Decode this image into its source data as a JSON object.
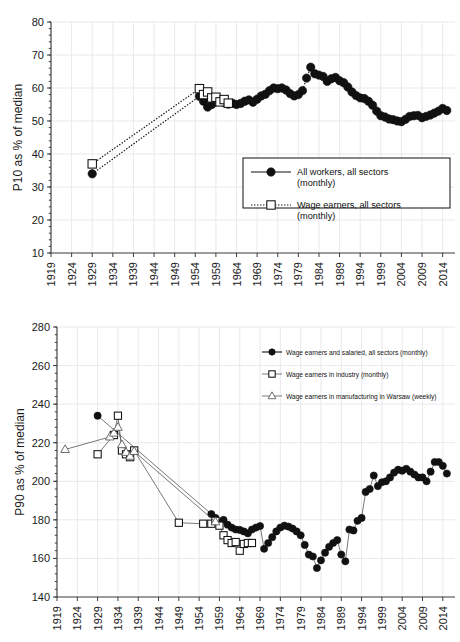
{
  "page": {
    "title_faint": ""
  },
  "charts": [
    {
      "id": "p10",
      "ylabel": "P10 as % of median",
      "xlabel": "",
      "legend_position": "inside-right"
    },
    {
      "id": "p90",
      "ylabel": "P90 as % of median",
      "xlabel": "",
      "legend_position": "inside-top-right"
    }
  ],
  "chart_data": [
    {
      "type": "line",
      "title": "",
      "xlabel": "",
      "ylabel": "P10 as % of median",
      "xlim": [
        1919,
        2017
      ],
      "ylim": [
        10,
        80
      ],
      "yticks": [
        10,
        20,
        30,
        40,
        50,
        60,
        70,
        80
      ],
      "xticks": [
        1919,
        1924,
        1929,
        1934,
        1939,
        1944,
        1949,
        1954,
        1959,
        1964,
        1969,
        1974,
        1979,
        1984,
        1989,
        1994,
        1999,
        2004,
        2009,
        2014
      ],
      "grid": true,
      "legend": [
        {
          "label": "All workers, all sectors (monthly)",
          "marker": "filled-circle",
          "line": "solid"
        },
        {
          "label": "Wage earners, all sectors (monthly)",
          "marker": "open-square",
          "line": "dotted"
        }
      ],
      "series": [
        {
          "name": "All workers, all sectors (monthly)",
          "marker": "filled-circle",
          "line": "dotted",
          "points": [
            [
              1929,
              34.0
            ],
            [
              1955,
              57.5
            ],
            [
              1956,
              56.0
            ],
            [
              1957,
              54.2
            ],
            [
              1958,
              55.0
            ],
            [
              1959,
              55.8
            ],
            [
              1960,
              56.3
            ],
            [
              1961,
              55.6
            ],
            [
              1962,
              55.1
            ],
            [
              1963,
              55.4
            ],
            [
              1964,
              55.0
            ],
            [
              1965,
              55.3
            ],
            [
              1966,
              56.0
            ],
            [
              1967,
              56.4
            ],
            [
              1968,
              55.7
            ],
            [
              1969,
              56.6
            ],
            [
              1970,
              57.6
            ],
            [
              1971,
              58.1
            ],
            [
              1972,
              59.2
            ],
            [
              1973,
              60.0
            ],
            [
              1974,
              59.8
            ],
            [
              1975,
              60.0
            ],
            [
              1976,
              59.4
            ],
            [
              1977,
              58.3
            ],
            [
              1978,
              57.6
            ],
            [
              1979,
              58.0
            ],
            [
              1980,
              59.2
            ],
            [
              1981,
              63.0
            ],
            [
              1982,
              66.3
            ],
            [
              1983,
              64.3
            ],
            [
              1984,
              63.9
            ],
            [
              1985,
              63.5
            ],
            [
              1986,
              62.0
            ],
            [
              1987,
              62.8
            ],
            [
              1988,
              63.2
            ],
            [
              1989,
              62.2
            ],
            [
              1990,
              61.6
            ],
            [
              1991,
              60.3
            ],
            [
              1992,
              58.8
            ],
            [
              1993,
              57.7
            ],
            [
              1994,
              57.0
            ],
            [
              1995,
              56.8
            ],
            [
              1996,
              56.0
            ],
            [
              1997,
              54.8
            ],
            [
              1998,
              53.0
            ],
            [
              1999,
              51.6
            ],
            [
              2000,
              51.2
            ],
            [
              2001,
              50.6
            ],
            [
              2002,
              50.4
            ],
            [
              2003,
              50.0
            ],
            [
              2004,
              49.8
            ],
            [
              2005,
              50.5
            ],
            [
              2006,
              51.4
            ],
            [
              2007,
              51.6
            ],
            [
              2008,
              51.7
            ],
            [
              2009,
              51.0
            ],
            [
              2010,
              51.4
            ],
            [
              2011,
              51.8
            ],
            [
              2012,
              52.4
            ],
            [
              2013,
              53.0
            ],
            [
              2014,
              53.8
            ],
            [
              2015,
              53.2
            ]
          ]
        },
        {
          "name": "Wage earners, all sectors (monthly)",
          "marker": "open-square",
          "line": "dotted",
          "points": [
            [
              1929,
              37.0
            ],
            [
              1955,
              59.8
            ],
            [
              1956,
              58.0
            ],
            [
              1957,
              58.8
            ],
            [
              1958,
              57.0
            ],
            [
              1959,
              57.2
            ],
            [
              1960,
              55.8
            ],
            [
              1961,
              56.5
            ],
            [
              1962,
              55.4
            ]
          ]
        }
      ]
    },
    {
      "type": "line",
      "title": "",
      "xlabel": "",
      "ylabel": "P90 as % of median",
      "xlim": [
        1919,
        2017
      ],
      "ylim": [
        140,
        280
      ],
      "yticks": [
        140,
        160,
        180,
        200,
        220,
        240,
        260,
        280
      ],
      "xticks": [
        1919,
        1924,
        1929,
        1934,
        1939,
        1944,
        1949,
        1954,
        1959,
        1964,
        1969,
        1974,
        1979,
        1984,
        1989,
        1994,
        1999,
        2004,
        2009,
        2014
      ],
      "grid": true,
      "legend": [
        {
          "label": "Wage earners and salaried, all sectors (monthly)",
          "marker": "filled-circle",
          "line": "solid"
        },
        {
          "label": "Wage earners in industry (monthly)",
          "marker": "open-square",
          "line": "thin"
        },
        {
          "label": "Wage earners in manufacturing in Warsaw (weekly)",
          "marker": "open-triangle",
          "line": "thin"
        }
      ],
      "series": [
        {
          "name": "Wage earners and salaried, all sectors (monthly)",
          "marker": "filled-circle",
          "line": "thin",
          "points": [
            [
              1929,
              234.0
            ],
            [
              1957,
              183.0
            ],
            [
              1958,
              181.0
            ],
            [
              1959,
              178.5
            ],
            [
              1960,
              180.0
            ],
            [
              1961,
              177.5
            ],
            [
              1962,
              176.0
            ],
            [
              1963,
              175.0
            ],
            [
              1964,
              174.8
            ],
            [
              1965,
              174.0
            ],
            [
              1966,
              173.0
            ],
            [
              1967,
              175.0
            ],
            [
              1968,
              176.0
            ],
            [
              1969,
              176.8
            ],
            [
              1970,
              165.0
            ],
            [
              1971,
              168.0
            ],
            [
              1972,
              171.0
            ],
            [
              1973,
              174.0
            ],
            [
              1974,
              176.0
            ],
            [
              1975,
              177.0
            ],
            [
              1976,
              176.5
            ],
            [
              1977,
              175.5
            ],
            [
              1978,
              174.0
            ],
            [
              1979,
              172.0
            ],
            [
              1980,
              167.0
            ],
            [
              1981,
              162.0
            ],
            [
              1982,
              161.0
            ],
            [
              1983,
              155.0
            ],
            [
              1984,
              159.0
            ],
            [
              1985,
              163.0
            ],
            [
              1986,
              166.0
            ],
            [
              1987,
              168.0
            ],
            [
              1988,
              169.5
            ],
            [
              1989,
              162.0
            ],
            [
              1990,
              158.5
            ],
            [
              1991,
              175.0
            ],
            [
              1992,
              174.5
            ],
            [
              1993,
              179.5
            ],
            [
              1994,
              181.0
            ],
            [
              1995,
              194.5
            ],
            [
              1996,
              196.0
            ],
            [
              1997,
              203.0
            ],
            [
              1998,
              197.5
            ],
            [
              1999,
              199.5
            ],
            [
              2000,
              200.0
            ],
            [
              2001,
              202.0
            ],
            [
              2002,
              204.5
            ],
            [
              2003,
              206.0
            ],
            [
              2004,
              205.5
            ],
            [
              2005,
              206.5
            ],
            [
              2006,
              205.0
            ],
            [
              2007,
              203.5
            ],
            [
              2008,
              202.0
            ],
            [
              2009,
              202.0
            ],
            [
              2010,
              200.0
            ],
            [
              2011,
              205.0
            ],
            [
              2012,
              210.0
            ],
            [
              2013,
              210.0
            ],
            [
              2014,
              208.0
            ],
            [
              2015,
              204.0
            ]
          ]
        },
        {
          "name": "Wage earners in industry (monthly)",
          "marker": "open-square",
          "line": "thin",
          "points": [
            [
              1929,
              214.0
            ],
            [
              1933,
              224.0
            ],
            [
              1934,
              234.0
            ],
            [
              1935,
              216.0
            ],
            [
              1936,
              214.0
            ],
            [
              1937,
              212.5
            ],
            [
              1938,
              216.0
            ],
            [
              1949,
              178.5
            ],
            [
              1955,
              178.0
            ],
            [
              1957,
              178.0
            ],
            [
              1958,
              179.5
            ],
            [
              1959,
              177.0
            ],
            [
              1960,
              172.0
            ],
            [
              1961,
              169.5
            ],
            [
              1962,
              168.0
            ],
            [
              1963,
              168.5
            ],
            [
              1964,
              164.0
            ],
            [
              1965,
              167.5
            ],
            [
              1966,
              168.0
            ],
            [
              1967,
              168.0
            ]
          ]
        },
        {
          "name": "Wage earners in manufacturing in Warsaw (weekly)",
          "marker": "open-triangle",
          "line": "thin",
          "points": [
            [
              1921,
              216.5
            ],
            [
              1932,
              223.0
            ],
            [
              1933,
              225.0
            ],
            [
              1934,
              228.0
            ],
            [
              1935,
              219.0
            ],
            [
              1936,
              215.0
            ],
            [
              1937,
              213.0
            ],
            [
              1938,
              215.5
            ],
            [
              1958,
              179.0
            ]
          ]
        }
      ]
    }
  ]
}
